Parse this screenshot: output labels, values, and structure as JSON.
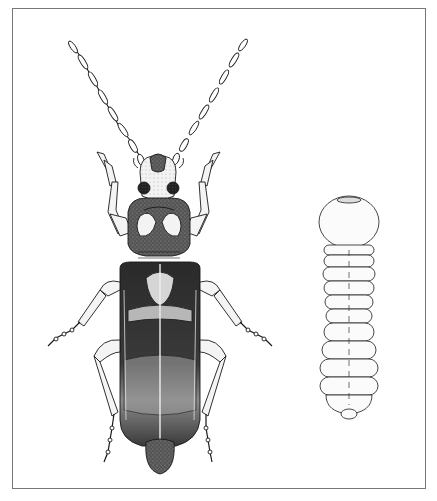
{
  "illustration": {
    "subject_adult": "beetle-dorsal-view",
    "subject_larva": "larva-dorsal-view",
    "colors": {
      "frame": "#777777",
      "ink": "#1a1a1a",
      "dark_fill": "#2b2b2b",
      "mid_fill": "#6e6e6e",
      "light_fill": "#e6e6e6",
      "paper": "#ffffff"
    }
  }
}
